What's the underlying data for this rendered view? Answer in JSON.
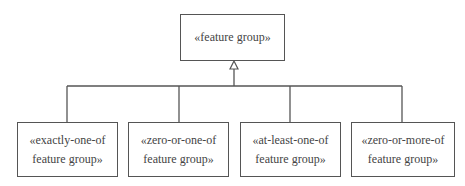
{
  "diagram": {
    "type": "uml-generalization",
    "parent": {
      "lines": [
        "«feature group»"
      ]
    },
    "children": [
      {
        "lines": [
          "«exactly-one-of",
          "feature group»"
        ]
      },
      {
        "lines": [
          "«zero-or-one-of",
          "feature group»"
        ]
      },
      {
        "lines": [
          "«at-least-one-of",
          "feature group»"
        ]
      },
      {
        "lines": [
          "«zero-or-more-of",
          "feature group»"
        ]
      }
    ],
    "relationship": "generalization (hollow triangle arrowhead pointing to parent)",
    "colors": {
      "stroke": "#555555",
      "text": "#444444",
      "background": "#ffffff"
    }
  }
}
